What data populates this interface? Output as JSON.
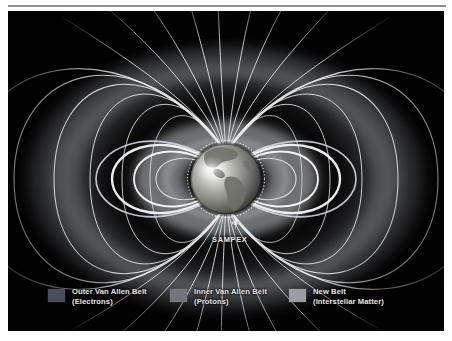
{
  "figure": {
    "background_color": "#000000",
    "frame_color": "#ffffff",
    "rule_color": "#8d8d8d"
  },
  "earth": {
    "label": "Earth",
    "sphere_light_color": "#f2f2ee",
    "sphere_mid_color": "#9a9a96",
    "sphere_dark_color": "#3a3a38",
    "continents_color": "#6e6e68",
    "continents_name": "north-and-south-america"
  },
  "satellite": {
    "name": "SAMPEX",
    "label": "SAMPEX",
    "icon": "satellite-icon",
    "pointer_icon": "arrow-pointer-icon",
    "body_color": "#e6e6e6"
  },
  "field_lines": {
    "name": "magnetic-field-lines",
    "color": "#f0f0f0",
    "count": 22
  },
  "belts": [
    {
      "id": "outer",
      "name": "outer-van-allen-belt",
      "label_line1": "Outer Van Allen Belt",
      "label_line2": "(Electrons)",
      "swatch_color": "#4b4e58",
      "glow_color": "#8d9097"
    },
    {
      "id": "inner",
      "name": "inner-van-allen-belt",
      "label_line1": "Inner Van Allen Belt",
      "label_line2": "(Protons)",
      "swatch_color": "#73757b",
      "glow_color": "#c9cbd0"
    },
    {
      "id": "new",
      "name": "new-belt-interstellar-matter",
      "label_line1": "New Belt",
      "label_line2": "(Interstellar Matter)",
      "swatch_color": "#9b9da2",
      "glow_color": "#eceef2"
    }
  ]
}
